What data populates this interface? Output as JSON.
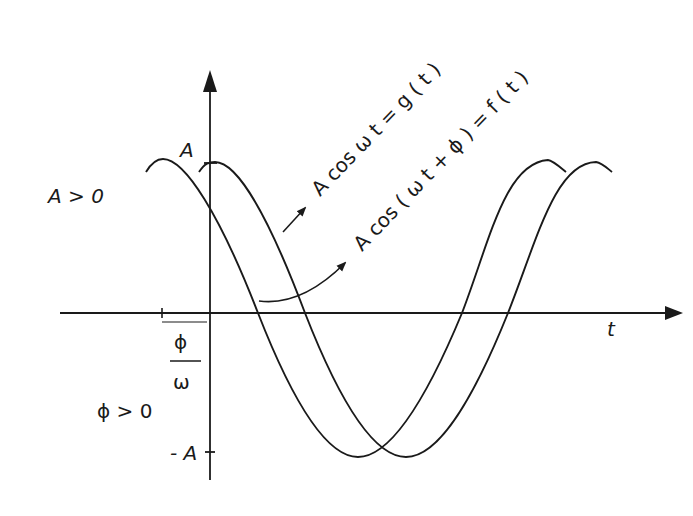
{
  "diagram": {
    "axes": {
      "horizontal_label": "t",
      "amplitude_top_label": "A",
      "amplitude_bottom_label": "- A",
      "shift_numerator": "ϕ",
      "shift_denominator": "ω"
    },
    "conditions": {
      "amplitude": "A > 0",
      "phase": "ϕ > 0"
    },
    "curves": [
      {
        "id": "g",
        "label": "A cos ω t = g ( t )"
      },
      {
        "id": "f",
        "label": "A cos ( ω t + ϕ ) = f ( t )"
      }
    ],
    "colors": {
      "ink": "#1a1a1a",
      "background": "#ffffff"
    }
  }
}
